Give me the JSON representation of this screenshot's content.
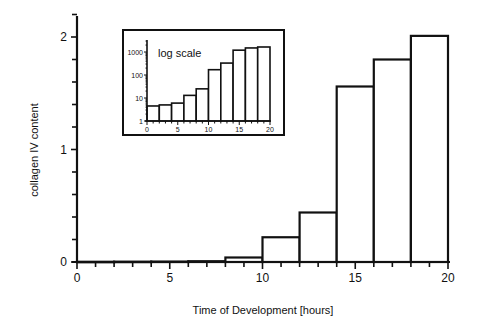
{
  "chart_data": [
    {
      "type": "bar",
      "role": "main",
      "title": "",
      "xlabel": "Time of Development [hours]",
      "ylabel": "collagen IV content",
      "bins": [
        [
          0,
          2
        ],
        [
          2,
          4
        ],
        [
          4,
          6
        ],
        [
          6,
          8
        ],
        [
          8,
          10
        ],
        [
          10,
          12
        ],
        [
          12,
          14
        ],
        [
          14,
          16
        ],
        [
          16,
          18
        ],
        [
          18,
          20
        ]
      ],
      "categories": [
        "0-2",
        "2-4",
        "4-6",
        "6-8",
        "8-10",
        "10-12",
        "12-14",
        "14-16",
        "16-18",
        "18-20"
      ],
      "values": [
        0.002,
        0.003,
        0.004,
        0.007,
        0.04,
        0.22,
        0.44,
        1.56,
        1.8,
        2.01
      ],
      "xlim": [
        0,
        20
      ],
      "ylim": [
        0,
        2.2
      ],
      "xticks": [
        0,
        5,
        10,
        15,
        20
      ],
      "xtick_labels": [
        "0",
        "5",
        "10",
        "15",
        "20"
      ],
      "yticks": [
        0,
        1,
        2
      ],
      "ytick_labels": [
        "0",
        "1",
        "2"
      ],
      "grid": false,
      "legend": null
    },
    {
      "type": "bar",
      "role": "inset",
      "annotation": "log scale",
      "yscale": "log",
      "bins": [
        [
          0,
          2
        ],
        [
          2,
          4
        ],
        [
          4,
          6
        ],
        [
          6,
          8
        ],
        [
          8,
          10
        ],
        [
          10,
          12
        ],
        [
          12,
          14
        ],
        [
          14,
          16
        ],
        [
          16,
          18
        ],
        [
          18,
          20
        ]
      ],
      "categories": [
        "0-2",
        "2-4",
        "4-6",
        "6-8",
        "8-10",
        "10-12",
        "12-14",
        "14-16",
        "16-18",
        "18-20"
      ],
      "values": [
        4.5,
        5,
        6,
        13,
        25,
        170,
        330,
        1200,
        1500,
        1650
      ],
      "xlim": [
        0,
        20
      ],
      "ylim": [
        1,
        3000
      ],
      "xticks": [
        0,
        5,
        10,
        15,
        20
      ],
      "xtick_labels": [
        "0",
        "5",
        "10",
        "15",
        "20"
      ],
      "yticks": [
        1,
        10,
        100,
        1000
      ],
      "ytick_labels": [
        "1",
        "10",
        "100",
        "1000"
      ]
    }
  ],
  "labels": {
    "xlabel": "Time of Development [hours]",
    "ylabel": "collagen IV content",
    "inset_annotation": "log scale"
  }
}
